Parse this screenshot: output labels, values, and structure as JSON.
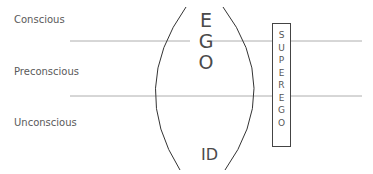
{
  "levels": [
    {
      "label": "Conscious"
    },
    {
      "label": "Preconscious"
    },
    {
      "label": "Unconscious"
    }
  ],
  "ego": {
    "letters": [
      "E",
      "G",
      "O"
    ]
  },
  "id": {
    "label": "ID"
  },
  "superego": {
    "letters": [
      "S",
      "U",
      "P",
      "E",
      "R",
      "E",
      "G",
      "O"
    ]
  },
  "colors": {
    "line": "#9a9a9a",
    "arc": "#333333",
    "box": "#444444",
    "text": "#555555"
  }
}
